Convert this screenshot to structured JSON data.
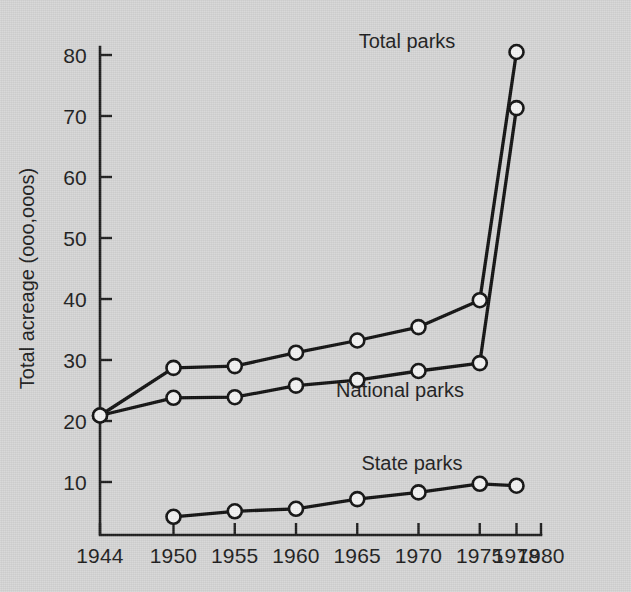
{
  "chart_data": {
    "type": "line",
    "title": "",
    "xlabel": "",
    "ylabel": "Total acreage (ooo,ooos)",
    "x": [
      1944,
      1950,
      1955,
      1960,
      1965,
      1970,
      1975,
      1978
    ],
    "xtick_labels": [
      "1944",
      "1950",
      "1955",
      "1960",
      "1965",
      "1970",
      "1975",
      "1978",
      "1980"
    ],
    "xticks": [
      1944,
      1950,
      1955,
      1960,
      1965,
      1970,
      1975,
      1978,
      1980
    ],
    "ytick_labels": [
      "10",
      "20",
      "30",
      "40",
      "50",
      "60",
      "70",
      "80"
    ],
    "yticks": [
      10,
      20,
      30,
      40,
      50,
      60,
      70,
      80
    ],
    "xlim": [
      1944,
      1980
    ],
    "ylim": [
      1,
      82
    ],
    "grid": false,
    "legend_position": "inline-annotations",
    "marker": "open-circle",
    "series": [
      {
        "name": "Total parks",
        "label": "Total parks",
        "x": [
          1944,
          1950,
          1955,
          1960,
          1965,
          1970,
          1975,
          1978
        ],
        "values": [
          20.9,
          28.7,
          29.0,
          31.2,
          33.2,
          35.4,
          39.8,
          80.5
        ]
      },
      {
        "name": "National parks",
        "label": "National parks",
        "x": [
          1944,
          1950,
          1955,
          1960,
          1965,
          1970,
          1975,
          1978
        ],
        "values": [
          20.9,
          23.8,
          23.9,
          25.8,
          26.7,
          28.2,
          29.5,
          71.3
        ]
      },
      {
        "name": "State parks",
        "label": "State parks",
        "x": [
          1950,
          1955,
          1960,
          1965,
          1970,
          1975,
          1978
        ],
        "values": [
          4.3,
          5.2,
          5.6,
          7.2,
          8.3,
          9.7,
          9.4
        ]
      }
    ],
    "annotations": [
      {
        "name": "total-parks-label",
        "text": "Total parks",
        "x_px": 407,
        "y_px": 48
      },
      {
        "name": "national-parks-label",
        "text": "National parks",
        "x_px": 400,
        "y_px": 397
      },
      {
        "name": "state-parks-label",
        "text": "State parks",
        "x_px": 412,
        "y_px": 470
      }
    ],
    "colors": {
      "background": "#d6d6d6",
      "ink": "#1d1d1d",
      "line": "#111111",
      "marker_fill": "#f4f4f4"
    }
  }
}
